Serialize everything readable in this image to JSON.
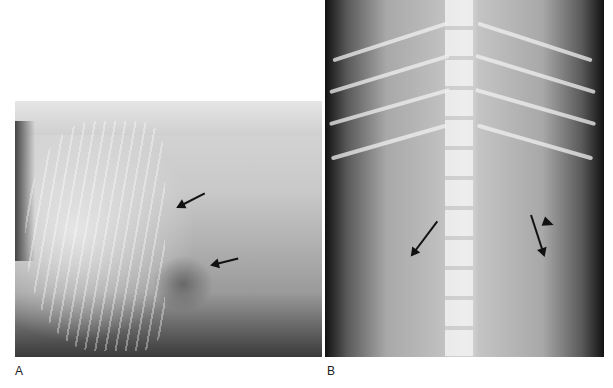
{
  "figure": {
    "panels": [
      {
        "label": "A",
        "view": "lateral-radiograph",
        "annotations": [
          "arrow",
          "arrow"
        ]
      },
      {
        "label": "B",
        "view": "ventrodorsal-radiograph",
        "annotations": [
          "arrow",
          "arrow",
          "arrowhead"
        ]
      }
    ]
  },
  "colors": {
    "background": "#ffffff",
    "annotation": "#111111",
    "label": "#222222"
  }
}
